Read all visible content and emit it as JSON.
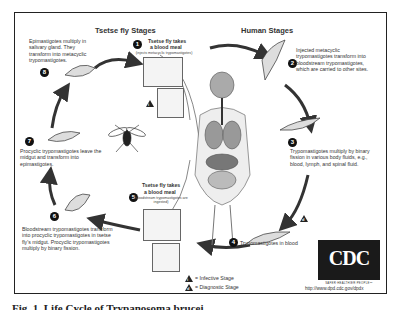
{
  "diagram": {
    "left_title": "Tsetse fly Stages",
    "right_title": "Human Stages",
    "stages": [
      {
        "number": "1",
        "title": "Tsetse fly takes",
        "title2": "a blood meal",
        "note": "(injects metacyclic trypomastigotes)"
      },
      {
        "number": "2",
        "text": "Injected metacyclic trypomastigotes transform into bloodstream trypomastigotes, which are carried to other sites."
      },
      {
        "number": "3",
        "text": "Trypomastigotes multiply by binary fission in various body fluids, e.g., blood, lymph, and spinal fluid."
      },
      {
        "number": "4",
        "text": "Trypomastigotes in blood"
      },
      {
        "number": "5",
        "title": "Tsetse fly takes",
        "title2": "a blood meal",
        "note": "(bloodstream trypomastigotes are ingested)"
      },
      {
        "number": "6",
        "text": "Bloodstream trypomastigotes transform into procyclic trypomastigotes in tsetse fly's midgut. Procyclic trypomastigotes multiply by binary fission."
      },
      {
        "number": "7",
        "text": "Procyclic trypomastigotes leave the midgut and transform into epimastigotes."
      },
      {
        "number": "8",
        "text": "Epimastigotes multiply in salivary gland. They transform into metacyclic trypomastigotes."
      }
    ],
    "legend": [
      {
        "symbol": "i",
        "label": "= Infective Stage"
      },
      {
        "symbol": "d",
        "label": "= Diagnostic Stage"
      }
    ],
    "logo": {
      "text": "CDC",
      "tagline": "SAFER·HEALTHIER·PEOPLE™",
      "url": "http://www.dpd.cdc.gov/dpdx"
    }
  },
  "caption": "Fig. 1. Life Cycle of Trypanosoma brucei"
}
